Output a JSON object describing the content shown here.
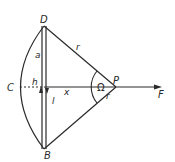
{
  "diagram": {
    "labels": {
      "D": "D",
      "B": "B",
      "C": "C",
      "P": "P",
      "F": "F",
      "r_upper": "r",
      "r_lower": "r",
      "a": "a",
      "h": "h",
      "l": "l",
      "x": "x",
      "omega": "Ω"
    },
    "colors": {
      "stroke": "#2a2a2a",
      "background": "#ffffff"
    }
  }
}
